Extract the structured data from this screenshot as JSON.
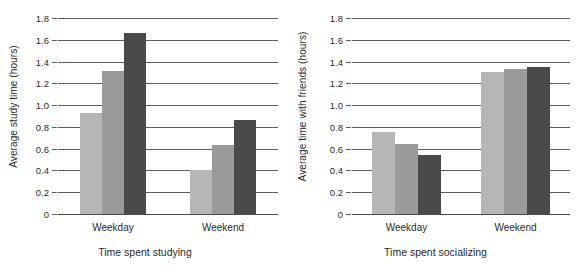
{
  "chart_data": [
    {
      "type": "bar",
      "title": "",
      "xlabel": "Time spent studying",
      "ylabel": "Average study time (hours)",
      "categories": [
        "Weekday",
        "Weekend"
      ],
      "ylim": [
        0,
        1.8
      ],
      "ytick_labels": [
        "0",
        "0.2",
        "0.4",
        "0.6",
        "0.8",
        "1.0",
        "1.2",
        "1.4",
        "1.6",
        "1.8"
      ],
      "ytick_values": [
        0,
        0.2,
        0.4,
        0.6,
        0.8,
        1.0,
        1.2,
        1.4,
        1.6,
        1.8
      ],
      "grid": true,
      "legend": "none",
      "series": [
        {
          "name": "series-1",
          "color": "#b6b6b6",
          "values": [
            0.93,
            0.4
          ]
        },
        {
          "name": "series-2",
          "color": "#9a9a9a",
          "values": [
            1.31,
            0.63
          ]
        },
        {
          "name": "series-3",
          "color": "#4a4a4a",
          "values": [
            1.66,
            0.86
          ]
        }
      ]
    },
    {
      "type": "bar",
      "title": "",
      "xlabel": "Time spent socializing",
      "ylabel": "Average time with friends (hours)",
      "categories": [
        "Weekday",
        "Weekend"
      ],
      "ylim": [
        0,
        1.8
      ],
      "ytick_labels": [
        "0",
        "0.2",
        "0.4",
        "0.6",
        "0.8",
        "1.0",
        "1.2",
        "1.4",
        "1.6",
        "1.8"
      ],
      "ytick_values": [
        0,
        0.2,
        0.4,
        0.6,
        0.8,
        1.0,
        1.2,
        1.4,
        1.6,
        1.8
      ],
      "grid": true,
      "legend": "none",
      "series": [
        {
          "name": "series-1",
          "color": "#b6b6b6",
          "values": [
            0.75,
            1.3
          ]
        },
        {
          "name": "series-2",
          "color": "#9a9a9a",
          "values": [
            0.64,
            1.33
          ]
        },
        {
          "name": "series-3",
          "color": "#4a4a4a",
          "values": [
            0.54,
            1.35
          ]
        }
      ]
    }
  ],
  "panels": [
    {
      "ylabel": "Average study time (hours)",
      "xlabel": "Time spent studying",
      "ytick_labels": [
        "1.8",
        "1.6",
        "1.4",
        "1.2",
        "1.0",
        "0.8",
        "0.6",
        "0.4",
        "0.2",
        "0"
      ],
      "categories": [
        "Weekday",
        "Weekend"
      ]
    },
    {
      "ylabel": "Average time with friends (hours)",
      "xlabel": "Time spent socializing",
      "ytick_labels": [
        "1.8",
        "1.6",
        "1.4",
        "1.2",
        "1.0",
        "0.8",
        "0.6",
        "0.4",
        "0.2",
        "0"
      ],
      "categories": [
        "Weekday",
        "Weekend"
      ]
    }
  ]
}
